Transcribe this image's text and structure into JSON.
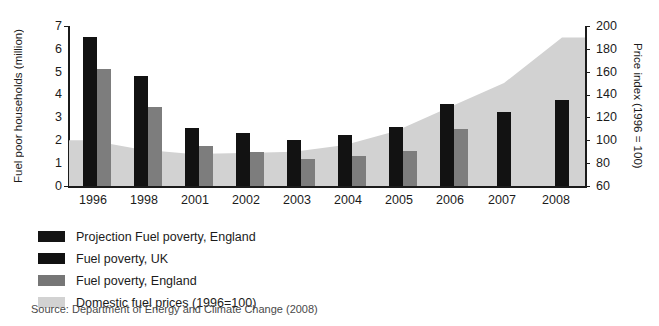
{
  "chart_data": {
    "type": "bar",
    "title": "",
    "subtitle": "",
    "xlabel": "",
    "ylabel": "Fuel poor households (million)",
    "y2label": "Price index (1996 = 100)",
    "categories": [
      "1996",
      "1998",
      "2001",
      "2002",
      "2003",
      "2004",
      "2005",
      "2006",
      "2007",
      "2008"
    ],
    "ylim": [
      0,
      7
    ],
    "y2lim": [
      60,
      200
    ],
    "yticks": [
      "0",
      "1",
      "2",
      "3",
      "4",
      "5",
      "6",
      "7"
    ],
    "y2ticks": [
      "60",
      "80",
      "100",
      "120",
      "140",
      "160",
      "180",
      "200"
    ],
    "grid": false,
    "legend_position": "below-plot",
    "series": [
      {
        "name": "Projection Fuel poverty, England",
        "color": "#141414",
        "axis": "left",
        "type": "bar",
        "values": [
          null,
          null,
          null,
          null,
          null,
          null,
          null,
          null,
          3.25,
          3.75
        ]
      },
      {
        "name": "Fuel poverty, UK",
        "color": "#111111",
        "axis": "left",
        "type": "bar",
        "values": [
          6.5,
          4.8,
          2.55,
          2.3,
          2.0,
          2.25,
          2.6,
          3.6,
          null,
          null
        ]
      },
      {
        "name": "Fuel poverty, England",
        "color": "#767676",
        "axis": "left",
        "type": "bar",
        "values": [
          5.1,
          3.45,
          1.75,
          1.5,
          1.2,
          1.3,
          1.55,
          2.5,
          null,
          null
        ]
      },
      {
        "name": "Domestic fuel prices (1996=100)",
        "color": "#d2d2d2",
        "axis": "right",
        "type": "area",
        "values": [
          100,
          92,
          88,
          89,
          90,
          96,
          108,
          128,
          150,
          190
        ]
      }
    ],
    "source": "Source: Department of Energy and Climate Change (2008)"
  },
  "legend": {
    "items": [
      {
        "label": "Projection Fuel poverty, England",
        "swatch": "sw-proj"
      },
      {
        "label": "Fuel poverty, UK",
        "swatch": "sw-uk"
      },
      {
        "label": "Fuel poverty, England",
        "swatch": "sw-eng"
      },
      {
        "label": "Domestic fuel prices (1996=100)",
        "swatch": "sw-price"
      }
    ]
  }
}
